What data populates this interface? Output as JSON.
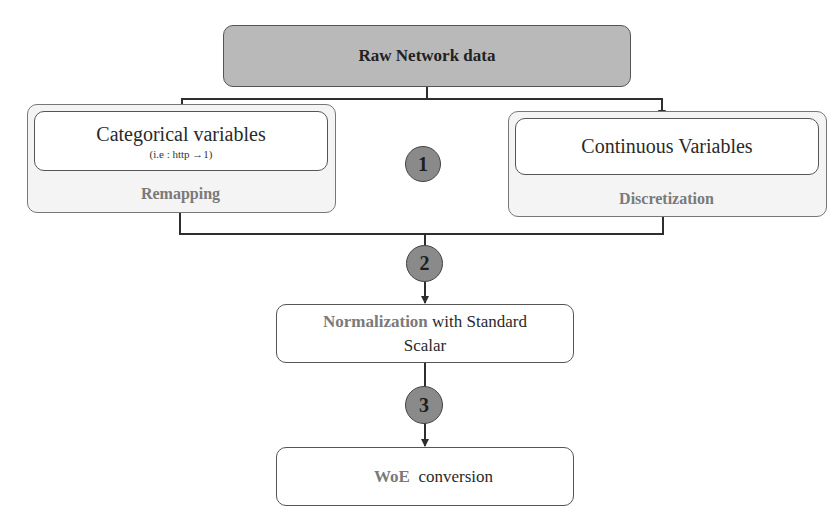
{
  "diagram": {
    "source": {
      "label": "Raw Network data"
    },
    "branches": [
      {
        "title": "Categorical variables",
        "subtitle": "(i.e : http →1)",
        "operation": "Remapping"
      },
      {
        "title": "Continuous Variables",
        "subtitle": "",
        "operation": "Discretization"
      }
    ],
    "steps": [
      {
        "number": "1"
      },
      {
        "number": "2"
      },
      {
        "number": "3"
      }
    ],
    "normalization": {
      "highlight": "Normalization",
      "rest_line1": " with Standard",
      "rest_line2": "Scalar"
    },
    "woe": {
      "highlight": "WoE",
      "rest": "  conversion"
    },
    "colors": {
      "source_fill": "#b9b9b9",
      "step_fill": "#8a8a8a",
      "highlight_text": "#7a7a7a",
      "outer_fill": "#f4f4f4"
    }
  }
}
